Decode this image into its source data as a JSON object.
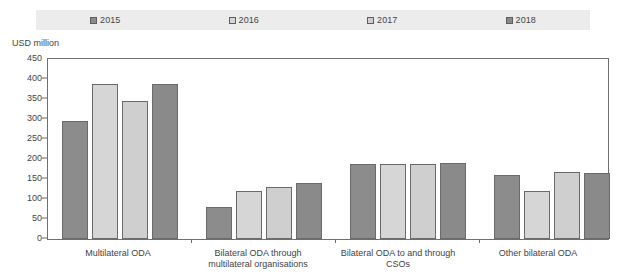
{
  "chart_data": {
    "type": "bar",
    "title": "",
    "subtitle": "",
    "xlabel": "",
    "ylabel": "USD million",
    "ylim": [
      0,
      450
    ],
    "yticks": [
      0,
      50,
      100,
      150,
      200,
      250,
      300,
      350,
      400,
      450
    ],
    "grid": false,
    "legend_position": "top",
    "categories": [
      "Multilateral ODA",
      "Bilateral ODA through multilateral organisations",
      "Bilateral ODA to and through CSOs",
      "Other bilateral ODA"
    ],
    "series": [
      {
        "name": "2015",
        "color": "#8c8c8c",
        "values": [
          295,
          80,
          187,
          160
        ]
      },
      {
        "name": "2016",
        "color": "#d6d6d6",
        "values": [
          388,
          120,
          187,
          120
        ]
      },
      {
        "name": "2017",
        "color": "#cfcfcf",
        "values": [
          345,
          130,
          188,
          168
        ]
      },
      {
        "name": "2018",
        "color": "#8a8a8a",
        "values": [
          388,
          140,
          190,
          165
        ]
      }
    ]
  },
  "legend": {
    "items": [
      {
        "label": "2015",
        "color": "#8c8c8c"
      },
      {
        "label": "2016",
        "color": "#d6d6d6"
      },
      {
        "label": "2017",
        "color": "#cfcfcf"
      },
      {
        "label": "2018",
        "color": "#8a8a8a"
      }
    ]
  },
  "axis": {
    "unit_caption": "USD million",
    "y_ticks": [
      "450",
      "400",
      "350",
      "300",
      "250",
      "200",
      "150",
      "100",
      "50",
      "0"
    ]
  },
  "categories": [
    "Multilateral ODA",
    "Bilateral ODA through multilateral organisations",
    "Bilateral ODA to and through CSOs",
    "Other bilateral ODA"
  ],
  "colors": {
    "legend_band": "#ececec",
    "axis_line": "#6f6f6f",
    "text": "#3f3f3f"
  }
}
